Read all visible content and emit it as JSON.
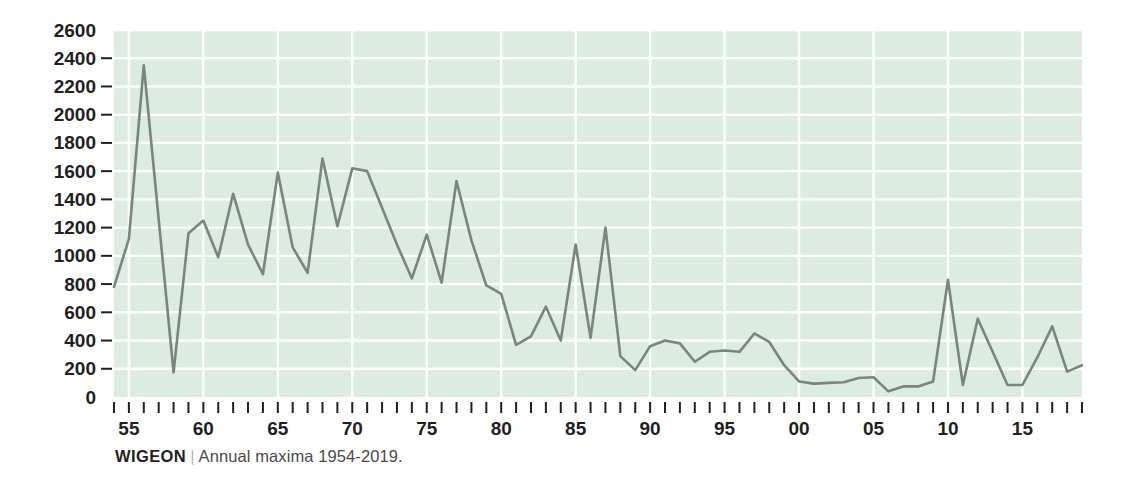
{
  "caption": {
    "name": "WIGEON",
    "separator": "|",
    "description": "Annual maxima 1954-2019."
  },
  "style": {
    "plot_background": "#dcece0",
    "grid_color": "#ffffff",
    "line_color": "#79857f",
    "text_color": "#231f20",
    "caption_muted": "#4a4a4a"
  },
  "chart_data": {
    "type": "line",
    "title": "WIGEON",
    "subtitle": "Annual maxima 1954-2019.",
    "xlabel": "",
    "ylabel": "",
    "ylim": [
      0,
      2600
    ],
    "xlim": [
      1954,
      2019
    ],
    "grid": true,
    "legend": "none",
    "y_ticks": [
      0,
      200,
      400,
      600,
      800,
      1000,
      1200,
      1400,
      1600,
      1800,
      2000,
      2200,
      2400,
      2600
    ],
    "y_tick_labels": [
      "0",
      "200",
      "400",
      "600",
      "800",
      "1000",
      "1200",
      "1400",
      "1600",
      "1800",
      "2000",
      "2200",
      "2400",
      "2600"
    ],
    "x_tick_labels": [
      {
        "year": 1955,
        "label": "55"
      },
      {
        "year": 1960,
        "label": "60"
      },
      {
        "year": 1965,
        "label": "65"
      },
      {
        "year": 1970,
        "label": "70"
      },
      {
        "year": 1975,
        "label": "75"
      },
      {
        "year": 1980,
        "label": "80"
      },
      {
        "year": 1985,
        "label": "85"
      },
      {
        "year": 1990,
        "label": "90"
      },
      {
        "year": 1995,
        "label": "95"
      },
      {
        "year": 2000,
        "label": "00"
      },
      {
        "year": 2005,
        "label": "05"
      },
      {
        "year": 2010,
        "label": "10"
      },
      {
        "year": 2015,
        "label": "15"
      }
    ],
    "x": [
      1954,
      1955,
      1956,
      1957,
      1958,
      1959,
      1960,
      1961,
      1962,
      1963,
      1964,
      1965,
      1966,
      1967,
      1968,
      1969,
      1970,
      1971,
      1972,
      1973,
      1974,
      1975,
      1976,
      1977,
      1978,
      1979,
      1980,
      1981,
      1982,
      1983,
      1984,
      1985,
      1986,
      1987,
      1988,
      1989,
      1990,
      1991,
      1992,
      1993,
      1994,
      1995,
      1996,
      1997,
      1998,
      1999,
      2000,
      2001,
      2002,
      2003,
      2004,
      2005,
      2006,
      2007,
      2008,
      2009,
      2010,
      2011,
      2012,
      2013,
      2014,
      2015,
      2016,
      2017,
      2018,
      2019
    ],
    "values": [
      780,
      1120,
      2350,
      1260,
      175,
      1160,
      1250,
      990,
      1440,
      1080,
      870,
      1590,
      1060,
      880,
      1690,
      1210,
      1620,
      1600,
      1340,
      1080,
      840,
      1150,
      810,
      1530,
      1110,
      790,
      730,
      370,
      430,
      640,
      400,
      1080,
      420,
      1200,
      290,
      190,
      360,
      400,
      380,
      250,
      320,
      330,
      320,
      450,
      390,
      225,
      110,
      95,
      100,
      105,
      135,
      140,
      40,
      75,
      75,
      110,
      830,
      85,
      555,
      320,
      85,
      85,
      280,
      500,
      180,
      225
    ],
    "series_name": "Annual maxima"
  }
}
